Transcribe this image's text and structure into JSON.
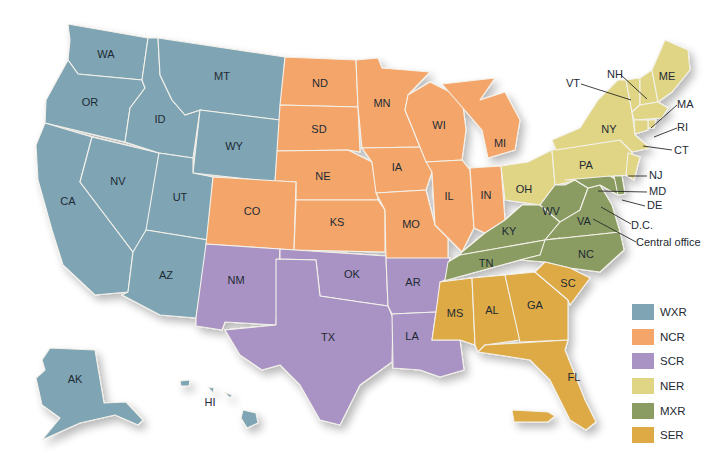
{
  "map": {
    "regions": [
      {
        "code": "WXR",
        "color": "#7fa5b5",
        "states": [
          "WA",
          "OR",
          "CA",
          "NV",
          "ID",
          "MT",
          "WY",
          "UT",
          "AZ",
          "AK",
          "HI"
        ]
      },
      {
        "code": "NCR",
        "color": "#f4a66a",
        "states": [
          "ND",
          "SD",
          "NE",
          "KS",
          "CO",
          "MN",
          "IA",
          "MO",
          "WI",
          "IL",
          "MI",
          "IN"
        ]
      },
      {
        "code": "SCR",
        "color": "#a893c4",
        "states": [
          "NM",
          "TX",
          "OK",
          "AR",
          "LA"
        ]
      },
      {
        "code": "NER",
        "color": "#dfd585",
        "states": [
          "OH",
          "PA",
          "NY",
          "VT",
          "NH",
          "ME",
          "MA",
          "RI",
          "CT",
          "NJ"
        ]
      },
      {
        "code": "MXR",
        "color": "#8a9c62",
        "states": [
          "KY",
          "WV",
          "VA",
          "TN",
          "NC",
          "MD",
          "DE",
          "D.C."
        ]
      },
      {
        "code": "SER",
        "color": "#ddaa45",
        "states": [
          "MS",
          "AL",
          "GA",
          "SC",
          "FL"
        ]
      }
    ],
    "state_labels": {
      "WA": "WA",
      "OR": "OR",
      "CA": "CA",
      "NV": "NV",
      "ID": "ID",
      "MT": "MT",
      "WY": "WY",
      "UT": "UT",
      "AZ": "AZ",
      "AK": "AK",
      "HI": "HI",
      "CO": "CO",
      "ND": "ND",
      "SD": "SD",
      "NE": "NE",
      "KS": "KS",
      "MN": "MN",
      "IA": "IA",
      "MO": "MO",
      "WI": "WI",
      "IL": "IL",
      "MI": "MI",
      "IN": "IN",
      "NM": "NM",
      "TX": "TX",
      "OK": "OK",
      "AR": "AR",
      "LA": "LA",
      "OH": "OH",
      "PA": "PA",
      "NY": "NY",
      "ME": "ME",
      "KY": "KY",
      "WV": "WV",
      "VA": "VA",
      "TN": "TN",
      "NC": "NC",
      "MS": "MS",
      "AL": "AL",
      "GA": "GA",
      "SC": "SC",
      "FL": "FL"
    },
    "callouts": {
      "VT": "VT",
      "NH": "NH",
      "MA": "MA",
      "RI": "RI",
      "CT": "CT",
      "NJ": "NJ",
      "MD": "MD",
      "DE": "DE",
      "DC": "D.C.",
      "central_office": "Central office"
    }
  },
  "legend": {
    "items": [
      {
        "label": "WXR",
        "color": "#7fa5b5"
      },
      {
        "label": "NCR",
        "color": "#f4a66a"
      },
      {
        "label": "SCR",
        "color": "#a893c4"
      },
      {
        "label": "NER",
        "color": "#dfd585"
      },
      {
        "label": "MXR",
        "color": "#8a9c62"
      },
      {
        "label": "SER",
        "color": "#ddaa45"
      }
    ]
  }
}
